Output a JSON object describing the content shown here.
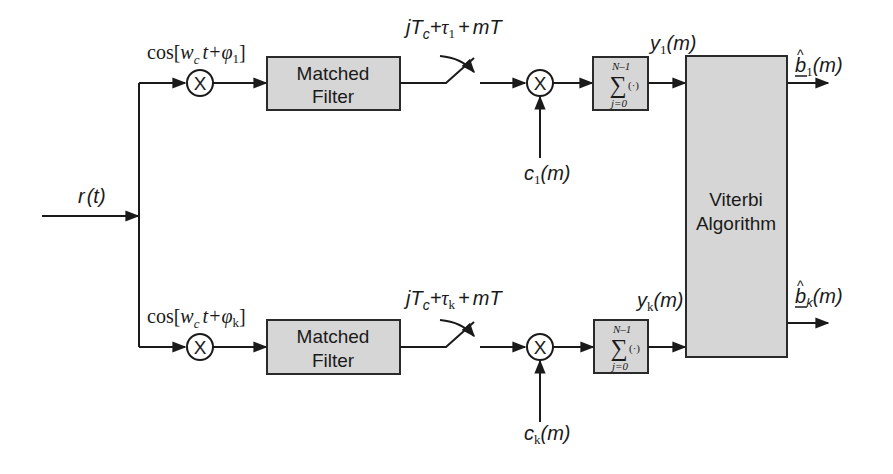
{
  "diagram": {
    "type": "block-diagram",
    "title": "",
    "input": {
      "label": "r(t)",
      "symbol": "r",
      "arg": "t"
    },
    "branches": [
      {
        "id": "1",
        "carrier": {
          "prefix": "cos[",
          "w": "w",
          "w_sub": "c",
          "t": "t+",
          "phi": "φ",
          "phi_sub": "1",
          "suffix": "]"
        },
        "matched_filter": {
          "line1": "Matched",
          "line2": "Filter"
        },
        "sampler": {
          "j": "j",
          "T": "T",
          "T_sub": "c",
          "plus1": "+",
          "tau": "τ",
          "tau_sub": "1",
          "plus2": "+",
          "mT": "mT"
        },
        "code": {
          "c": "c",
          "sub": "1",
          "arg": "(m)"
        },
        "summation": {
          "upper": "N–1",
          "sigma": "∑",
          "operand": "(·)",
          "lower": "j=0"
        },
        "output_y": {
          "y": "y",
          "sub": "1",
          "arg": "(m)"
        },
        "decision": {
          "b": "b",
          "hat": "^",
          "sub": "1",
          "arg": "(m)"
        }
      },
      {
        "id": "k",
        "carrier": {
          "prefix": "cos[",
          "w": "w",
          "w_sub": "c",
          "t": "t+",
          "phi": "φ",
          "phi_sub": "k",
          "suffix": "]"
        },
        "matched_filter": {
          "line1": "Matched",
          "line2": "Filter"
        },
        "sampler": {
          "j": "j",
          "T": "T",
          "T_sub": "c",
          "plus1": "+",
          "tau": "τ",
          "tau_sub": "k",
          "plus2": "+",
          "mT": "mT"
        },
        "code": {
          "c": "c",
          "sub": "k",
          "arg": "(m)"
        },
        "summation": {
          "upper": "N–1",
          "sigma": "∑",
          "operand": "(·)",
          "lower": "j=0"
        },
        "output_y": {
          "y": "y",
          "sub": "k",
          "arg": "(m)"
        },
        "decision": {
          "b": "b",
          "hat": "^",
          "sub": "k",
          "arg": "(m)"
        }
      }
    ],
    "viterbi": {
      "line1": "Viterbi",
      "line2": "Algorithm"
    },
    "multiplier_symbol": "X",
    "colors": {
      "box_fill": "#d6d6d6",
      "stroke": "#1a1a1a",
      "background": "#ffffff"
    }
  }
}
